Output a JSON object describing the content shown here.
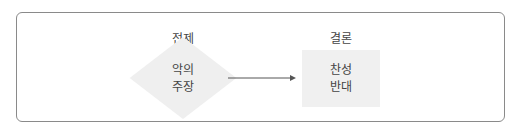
{
  "diagram": {
    "premise": {
      "heading": "전제",
      "lines": [
        "악의",
        "주장"
      ],
      "shape": "diamond",
      "fill": "#efefef"
    },
    "conclusion": {
      "heading": "결론",
      "lines": [
        "찬성",
        "반대"
      ],
      "shape": "rectangle",
      "fill": "#f0f0f0"
    },
    "connector": {
      "from": "premise",
      "to": "conclusion",
      "type": "arrow"
    },
    "colors": {
      "frame_border": "#8a8a8a",
      "text": "#444444",
      "arrow": "#555555"
    }
  }
}
